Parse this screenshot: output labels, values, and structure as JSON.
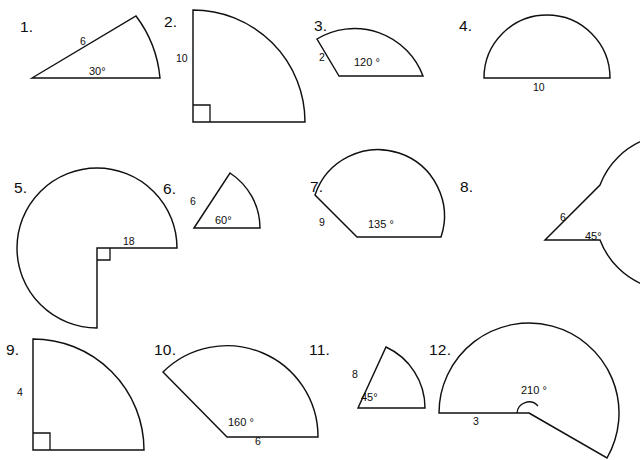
{
  "page": {
    "background_color": "#ffffff",
    "stroke_color": "#101010",
    "figure_count": 12
  },
  "figures": [
    {
      "number": "1.",
      "angle_label": "30°",
      "radius_label": "6",
      "angle_deg": 30,
      "radius": 6,
      "shape": "sector",
      "right_angle_mark": false
    },
    {
      "number": "2.",
      "angle_label": "",
      "radius_label": "10",
      "angle_deg": 90,
      "radius": 10,
      "shape": "quarter-circle",
      "right_angle_mark": true
    },
    {
      "number": "3.",
      "angle_label": "120 °",
      "radius_label": "2",
      "angle_deg": 120,
      "radius": 2,
      "shape": "sector",
      "right_angle_mark": false
    },
    {
      "number": "4.",
      "angle_label": "",
      "radius_label": "10",
      "angle_deg": 180,
      "radius": 10,
      "shape": "semicircle",
      "right_angle_mark": false
    },
    {
      "number": "5.",
      "angle_label": "",
      "radius_label": "18",
      "angle_deg": 270,
      "radius": 18,
      "shape": "reflex-sector",
      "right_angle_mark": true
    },
    {
      "number": "6.",
      "angle_label": "60°",
      "radius_label": "6",
      "angle_deg": 60,
      "radius": 6,
      "shape": "sector",
      "right_angle_mark": false
    },
    {
      "number": "7.",
      "angle_label": "135 °",
      "radius_label": "9",
      "angle_deg": 135,
      "radius": 9,
      "shape": "sector",
      "right_angle_mark": false
    },
    {
      "number": "8.",
      "angle_label": "45°",
      "radius_label": "6",
      "angle_deg": 315,
      "radius": 6,
      "shape": "reflex-sector",
      "right_angle_mark": false
    },
    {
      "number": "9.",
      "angle_label": "",
      "radius_label": "4",
      "angle_deg": 90,
      "radius": 4,
      "shape": "quarter-circle",
      "right_angle_mark": true
    },
    {
      "number": "10.",
      "angle_label": "160 °",
      "radius_label": "6",
      "angle_deg": 160,
      "radius": 6,
      "shape": "sector",
      "right_angle_mark": false
    },
    {
      "number": "11.",
      "angle_label": "45°",
      "radius_label": "8",
      "angle_deg": 45,
      "radius": 8,
      "shape": "sector",
      "right_angle_mark": false
    },
    {
      "number": "12.",
      "angle_label": "210 °",
      "radius_label": "3",
      "angle_deg": 210,
      "radius": 3,
      "shape": "reflex-sector",
      "right_angle_mark": false
    }
  ]
}
